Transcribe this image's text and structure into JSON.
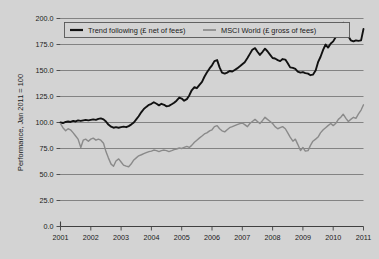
{
  "chart_data": {
    "type": "line",
    "title": "",
    "xlabel": "",
    "ylabel": "Performance, Jan 2011 = 100",
    "xlim": [
      2001,
      2011
    ],
    "ylim": [
      0,
      200
    ],
    "grid": true,
    "legend_position": "top",
    "background_color": "#d3d3d3",
    "plot_background_color": "#d3d3d3",
    "gridline_color": "#6e6e6e",
    "axis_color": "#404040",
    "ytick_labels": [
      "0.0",
      "25.0",
      "50.0",
      "75.0",
      "100.0",
      "125.0",
      "150.0",
      "175.0",
      "200.0"
    ],
    "ytick_values": [
      0,
      25,
      50,
      75,
      100,
      125,
      150,
      175,
      200
    ],
    "xtick_labels": [
      "2001",
      "2002",
      "2003",
      "2004",
      "2005",
      "2006",
      "2007",
      "2008",
      "2009",
      "2010",
      "2011"
    ],
    "xtick_values": [
      2001,
      2002,
      2003,
      2004,
      2005,
      2006,
      2007,
      2008,
      2009,
      2010,
      2011
    ],
    "series": [
      {
        "name": "Trend following (£ net of fees)",
        "color": "#111111",
        "width": 1.9,
        "x": [
          2001.0,
          2001.08,
          2001.17,
          2001.25,
          2001.33,
          2001.42,
          2001.5,
          2001.58,
          2001.67,
          2001.75,
          2001.83,
          2001.92,
          2002.0,
          2002.08,
          2002.17,
          2002.25,
          2002.33,
          2002.42,
          2002.5,
          2002.58,
          2002.67,
          2002.75,
          2002.83,
          2002.92,
          2003.0,
          2003.08,
          2003.17,
          2003.25,
          2003.33,
          2003.42,
          2003.5,
          2003.58,
          2003.67,
          2003.75,
          2003.83,
          2003.92,
          2004.0,
          2004.08,
          2004.17,
          2004.25,
          2004.33,
          2004.42,
          2004.5,
          2004.58,
          2004.67,
          2004.75,
          2004.83,
          2004.92,
          2005.0,
          2005.08,
          2005.17,
          2005.25,
          2005.33,
          2005.42,
          2005.5,
          2005.58,
          2005.67,
          2005.75,
          2005.83,
          2005.92,
          2006.0,
          2006.08,
          2006.17,
          2006.25,
          2006.33,
          2006.42,
          2006.5,
          2006.58,
          2006.67,
          2006.75,
          2006.83,
          2006.92,
          2007.0,
          2007.08,
          2007.17,
          2007.25,
          2007.33,
          2007.42,
          2007.5,
          2007.58,
          2007.67,
          2007.75,
          2007.83,
          2007.92,
          2008.0,
          2008.08,
          2008.17,
          2008.25,
          2008.33,
          2008.42,
          2008.5,
          2008.58,
          2008.67,
          2008.75,
          2008.83,
          2008.92,
          2009.0,
          2009.08,
          2009.17,
          2009.25,
          2009.33,
          2009.42,
          2009.5,
          2009.58,
          2009.67,
          2009.75,
          2009.83,
          2009.92,
          2010.0,
          2010.08,
          2010.17,
          2010.25,
          2010.33,
          2010.42,
          2010.5,
          2010.58,
          2010.67,
          2010.75,
          2010.83,
          2010.92,
          2011.0
        ],
        "values": [
          100.0,
          99.5,
          100.5,
          101.0,
          100.5,
          101.5,
          101.0,
          102.0,
          101.5,
          102.0,
          102.5,
          102.0,
          102.5,
          103.0,
          102.5,
          103.5,
          104.0,
          103.0,
          101.0,
          98.0,
          96.0,
          95.0,
          95.5,
          95.0,
          95.5,
          96.0,
          95.5,
          96.5,
          98.0,
          100.0,
          103.0,
          106.0,
          110.0,
          113.0,
          115.0,
          117.0,
          118.0,
          119.5,
          118.0,
          116.5,
          118.0,
          117.0,
          115.5,
          116.0,
          117.5,
          119.0,
          121.0,
          124.0,
          123.0,
          121.0,
          122.5,
          126.0,
          131.0,
          134.0,
          133.0,
          136.0,
          139.0,
          144.0,
          148.0,
          152.0,
          155.0,
          159.0,
          160.0,
          153.0,
          148.0,
          147.0,
          148.0,
          149.5,
          149.0,
          150.5,
          152.0,
          154.0,
          156.0,
          158.0,
          162.0,
          166.0,
          170.0,
          171.5,
          168.0,
          165.0,
          168.0,
          171.0,
          168.5,
          165.0,
          162.0,
          161.5,
          160.0,
          159.0,
          161.0,
          160.5,
          157.0,
          153.0,
          152.5,
          151.5,
          149.0,
          148.0,
          148.5,
          147.5,
          147.0,
          145.5,
          146.0,
          150.0,
          158.0,
          163.0,
          170.0,
          175.0,
          172.0,
          176.0,
          178.0,
          182.0,
          188.0,
          194.0,
          196.0,
          190.0,
          183.0,
          179.0,
          178.0,
          179.0,
          178.5,
          179.0,
          190.0
        ]
      },
      {
        "name": "MSCI World (£ gross of fees)",
        "color": "#8a8a8a",
        "width": 1.4,
        "x": [
          2001.0,
          2001.08,
          2001.17,
          2001.25,
          2001.33,
          2001.42,
          2001.5,
          2001.58,
          2001.67,
          2001.75,
          2001.83,
          2001.92,
          2002.0,
          2002.08,
          2002.17,
          2002.25,
          2002.33,
          2002.42,
          2002.5,
          2002.58,
          2002.67,
          2002.75,
          2002.83,
          2002.92,
          2003.0,
          2003.08,
          2003.17,
          2003.25,
          2003.33,
          2003.42,
          2003.5,
          2003.58,
          2003.67,
          2003.75,
          2003.83,
          2003.92,
          2004.0,
          2004.08,
          2004.17,
          2004.25,
          2004.33,
          2004.42,
          2004.5,
          2004.58,
          2004.67,
          2004.75,
          2004.83,
          2004.92,
          2005.0,
          2005.08,
          2005.17,
          2005.25,
          2005.33,
          2005.42,
          2005.5,
          2005.58,
          2005.67,
          2005.75,
          2005.83,
          2005.92,
          2006.0,
          2006.08,
          2006.17,
          2006.25,
          2006.33,
          2006.42,
          2006.5,
          2006.58,
          2006.67,
          2006.75,
          2006.83,
          2006.92,
          2007.0,
          2007.08,
          2007.17,
          2007.25,
          2007.33,
          2007.42,
          2007.5,
          2007.58,
          2007.67,
          2007.75,
          2007.83,
          2007.92,
          2008.0,
          2008.08,
          2008.17,
          2008.25,
          2008.33,
          2008.42,
          2008.5,
          2008.58,
          2008.67,
          2008.75,
          2008.83,
          2008.92,
          2009.0,
          2009.08,
          2009.17,
          2009.25,
          2009.33,
          2009.42,
          2009.5,
          2009.58,
          2009.67,
          2009.75,
          2009.83,
          2009.92,
          2010.0,
          2010.08,
          2010.17,
          2010.25,
          2010.33,
          2010.42,
          2010.5,
          2010.58,
          2010.67,
          2010.75,
          2010.83,
          2010.92,
          2011.0
        ],
        "values": [
          99.0,
          95.0,
          92.0,
          94.0,
          93.0,
          90.0,
          87.0,
          84.0,
          76.0,
          83.0,
          84.0,
          82.0,
          84.0,
          85.0,
          83.0,
          84.0,
          83.0,
          80.0,
          72.0,
          66.0,
          60.0,
          58.0,
          63.0,
          65.0,
          62.0,
          59.0,
          58.0,
          57.5,
          60.0,
          64.0,
          66.0,
          68.0,
          69.0,
          70.0,
          71.0,
          72.0,
          72.5,
          73.5,
          73.0,
          72.0,
          73.0,
          73.5,
          73.0,
          72.0,
          73.0,
          74.0,
          74.5,
          75.5,
          75.0,
          76.0,
          77.0,
          76.0,
          78.0,
          81.0,
          83.0,
          85.0,
          87.0,
          89.0,
          90.0,
          92.0,
          93.0,
          96.0,
          97.0,
          94.0,
          92.0,
          91.0,
          93.0,
          95.0,
          96.0,
          97.0,
          98.0,
          99.0,
          99.5,
          98.0,
          96.0,
          99.0,
          101.0,
          103.0,
          101.0,
          99.0,
          102.0,
          105.0,
          103.0,
          101.0,
          99.0,
          96.0,
          94.0,
          95.0,
          96.0,
          94.0,
          90.0,
          86.0,
          82.0,
          84.0,
          79.0,
          73.0,
          76.0,
          72.5,
          73.0,
          78.0,
          82.0,
          84.0,
          86.0,
          90.0,
          93.0,
          95.0,
          97.0,
          99.0,
          97.0,
          99.0,
          103.0,
          105.0,
          108.0,
          104.0,
          101.0,
          103.0,
          105.0,
          104.0,
          108.0,
          112.0,
          117.0
        ]
      }
    ]
  },
  "legend": {
    "items": [
      {
        "label": "Trend following (£ net of fees)",
        "color": "#111111",
        "width": 2.2
      },
      {
        "label": "MSCI World (£ gross of fees)",
        "color": "#8a8a8a",
        "width": 1.7
      }
    ]
  }
}
